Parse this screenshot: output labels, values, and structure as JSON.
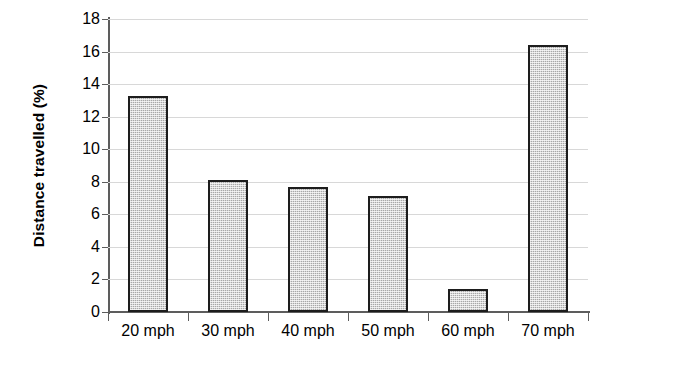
{
  "chart_data": {
    "type": "bar",
    "title": "",
    "xlabel": "",
    "ylabel": "Distance travelled (%)",
    "categories": [
      "20 mph",
      "30 mph",
      "40 mph",
      "50 mph",
      "60 mph",
      "70 mph"
    ],
    "values": [
      13.3,
      8.1,
      7.7,
      7.1,
      1.4,
      16.4
    ],
    "ylim": [
      0,
      18
    ],
    "ytick_step": 2,
    "yticks": [
      0,
      2,
      4,
      6,
      8,
      10,
      12,
      14,
      16,
      18
    ],
    "ytick_labels": [
      "0",
      "2",
      "4",
      "6",
      "8",
      "10",
      "12",
      "14",
      "16",
      "18"
    ],
    "grid": true,
    "grid_axis": "y",
    "legend": false,
    "legend_position": "none",
    "series": [
      {
        "name": "Distance travelled (%)",
        "values": [
          13.3,
          8.1,
          7.7,
          7.1,
          1.4,
          16.4
        ]
      }
    ],
    "colors": {
      "bar_fill": "#a8a8a8",
      "bar_border": "#1d1d1d",
      "axis": "#5d5d5d",
      "gridline": "#d8d8d8",
      "text": "#000000",
      "background": "#ffffff"
    }
  }
}
